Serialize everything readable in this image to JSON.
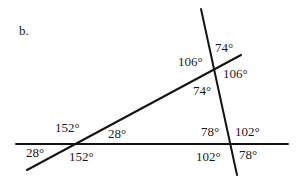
{
  "figure": {
    "part_label": "b.",
    "lines": [
      {
        "name": "horizontal-line",
        "x1": 16,
        "y1": 144,
        "x2": 288,
        "y2": 144
      },
      {
        "name": "diagonal-line",
        "x1": 27,
        "y1": 170,
        "x2": 241,
        "y2": 55
      },
      {
        "name": "steep-line",
        "x1": 201,
        "y1": 9,
        "x2": 237,
        "y2": 175
      }
    ],
    "angles": [
      {
        "name": "angle-top-right-upper",
        "text": "74°",
        "x": 215,
        "y": 52
      },
      {
        "name": "angle-top-left-upper",
        "text": "106°",
        "x": 178,
        "y": 66
      },
      {
        "name": "angle-top-right-lower",
        "text": "106°",
        "x": 223,
        "y": 78
      },
      {
        "name": "angle-top-left-lower",
        "text": "74°",
        "x": 193,
        "y": 95
      },
      {
        "name": "angle-left-upper-left",
        "text": "152°",
        "x": 55,
        "y": 132
      },
      {
        "name": "angle-left-upper-right",
        "text": "28°",
        "x": 108,
        "y": 138
      },
      {
        "name": "angle-left-lower-left",
        "text": "28°",
        "x": 26,
        "y": 157
      },
      {
        "name": "angle-left-lower-right",
        "text": "152°",
        "x": 69,
        "y": 161
      },
      {
        "name": "angle-right-upper-left",
        "text": "78°",
        "x": 201,
        "y": 136
      },
      {
        "name": "angle-right-upper-right",
        "text": "102°",
        "x": 235,
        "y": 136
      },
      {
        "name": "angle-right-lower-left",
        "text": "102°",
        "x": 196,
        "y": 161
      },
      {
        "name": "angle-right-lower-right",
        "text": "78°",
        "x": 239,
        "y": 159
      }
    ],
    "colors": {
      "ink": "#141414",
      "background": "#ffffff"
    }
  }
}
